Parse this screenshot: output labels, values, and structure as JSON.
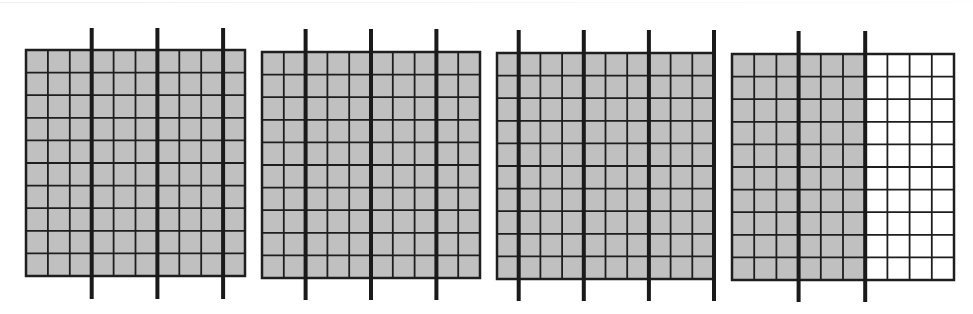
{
  "figure": {
    "total_shaded_cells": 360,
    "grid_rows": 10,
    "grid_cols": 10,
    "fill_color": "#c0c0c0",
    "empty_color": "#ffffff",
    "line_color": "#1e1e1e",
    "thick_line_color": "#1a1a1a",
    "group_size_columns": 3
  },
  "grids": [
    {
      "id": "grid-1",
      "x": 26,
      "y": 50,
      "w": 219,
      "h": 226,
      "shaded_columns": 10,
      "divider_after_columns": [
        3,
        6,
        9
      ],
      "divider_top": 28,
      "divider_bottom": 299
    },
    {
      "id": "grid-2",
      "x": 262,
      "y": 52,
      "w": 218,
      "h": 226,
      "shaded_columns": 10,
      "divider_after_columns": [
        2,
        5,
        8
      ],
      "divider_top": 29,
      "divider_bottom": 300
    },
    {
      "id": "grid-3",
      "x": 497,
      "y": 53,
      "w": 217,
      "h": 226,
      "shaded_columns": 10,
      "divider_after_columns": [
        1,
        4,
        7,
        10
      ],
      "divider_top": 30,
      "divider_bottom": 301
    },
    {
      "id": "grid-4",
      "x": 732,
      "y": 54,
      "w": 222,
      "h": 226,
      "shaded_columns": 6,
      "divider_after_columns": [
        3,
        6
      ],
      "divider_top": 31,
      "divider_bottom": 302
    }
  ]
}
